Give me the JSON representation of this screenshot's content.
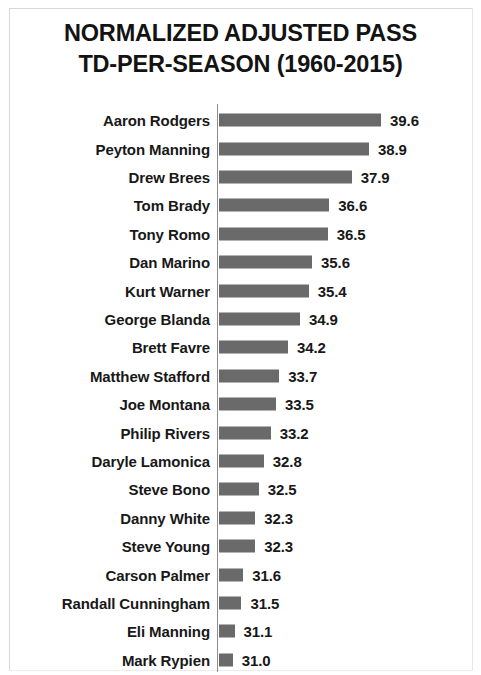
{
  "chart_data": {
    "type": "bar",
    "orientation": "horizontal",
    "title": "NORMALIZED ADJUSTED PASS TD-PER-SEASON (1960-2015)",
    "title_lines": [
      "NORMALIZED ADJUSTED PASS",
      "TD-PER-SEASON (1960-2015)"
    ],
    "xlabel": "",
    "ylabel": "",
    "grid": false,
    "legend": false,
    "bar_color": "#6a6a6a",
    "text_color": "#181818",
    "axis_color": "#8d8d8d",
    "background": "#ffffff",
    "value_axis_visual_min": 30.2,
    "value_axis_visual_max": 40.0,
    "categories": [
      "Aaron Rodgers",
      "Peyton Manning",
      "Drew Brees",
      "Tom Brady",
      "Tony Romo",
      "Dan Marino",
      "Kurt Warner",
      "George Blanda",
      "Brett Favre",
      "Matthew Stafford",
      "Joe Montana",
      "Philip Rivers",
      "Daryle Lamonica",
      "Steve Bono",
      "Danny White",
      "Steve Young",
      "Carson Palmer",
      "Randall Cunningham",
      "Eli Manning",
      "Mark Rypien"
    ],
    "values": [
      39.6,
      38.9,
      37.9,
      36.6,
      36.5,
      35.6,
      35.4,
      34.9,
      34.2,
      33.7,
      33.5,
      33.2,
      32.8,
      32.5,
      32.3,
      32.3,
      31.6,
      31.5,
      31.1,
      31.0
    ],
    "value_labels": [
      "39.6",
      "38.9",
      "37.9",
      "36.6",
      "36.5",
      "35.6",
      "35.4",
      "34.9",
      "34.2",
      "33.7",
      "33.5",
      "33.2",
      "32.8",
      "32.5",
      "32.3",
      "32.3",
      "31.6",
      "31.5",
      "31.1",
      "31.0"
    ]
  }
}
